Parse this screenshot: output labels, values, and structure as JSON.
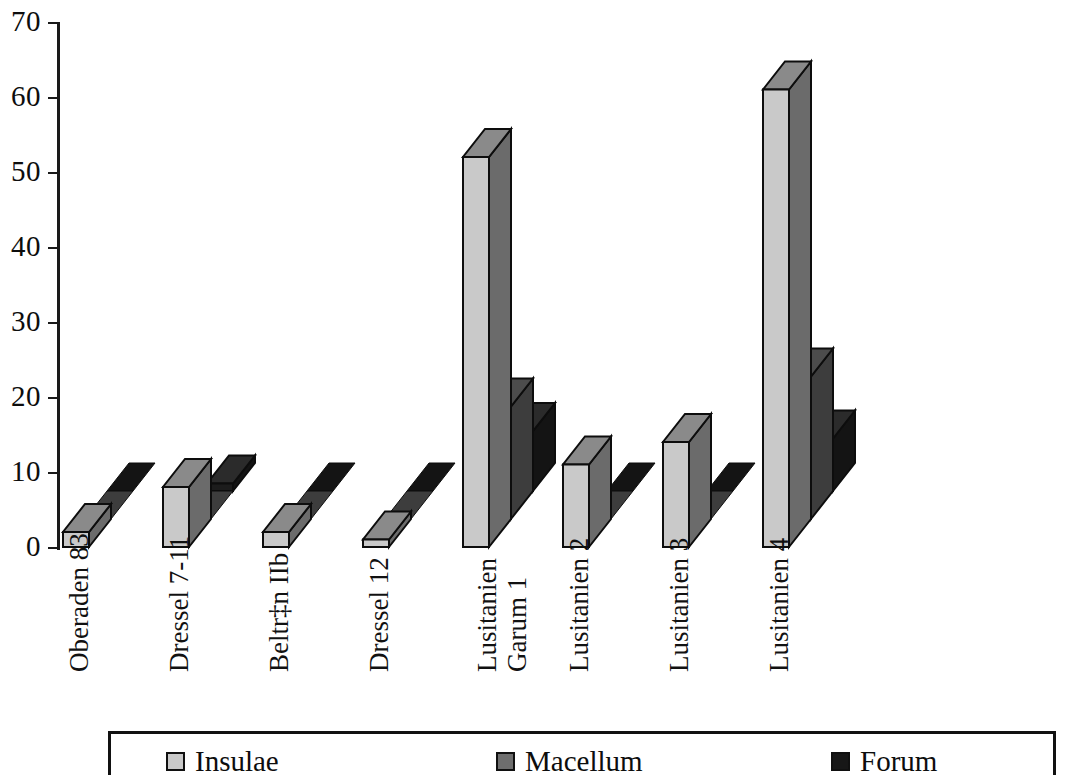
{
  "chart_data": {
    "type": "bar",
    "title": "",
    "subtitle": "",
    "xlabel": "",
    "ylabel": "",
    "ylim": [
      0,
      70
    ],
    "yticks": [
      0,
      10,
      20,
      30,
      40,
      50,
      60,
      70
    ],
    "ytick_labels": [
      "0",
      "10",
      "20",
      "30",
      "40",
      "50",
      "60",
      "70"
    ],
    "grid": false,
    "legend_position": "bottom",
    "three_d": true,
    "categories": [
      "Oberaden 83",
      "Dressel 7-11",
      "Beltr‡n IIb",
      "Dressel 12",
      "Lusitanien Garum 1",
      "Lusitanien 2",
      "Lusitanien 3",
      "Lusitanien 4"
    ],
    "category_lines": [
      [
        "Oberaden 83"
      ],
      [
        "Dressel 7-11"
      ],
      [
        "Beltr‡n IIb"
      ],
      [
        "Dressel 12"
      ],
      [
        "Lusitanien",
        "Garum 1"
      ],
      [
        "Lusitanien 2"
      ],
      [
        "Lusitanien 3"
      ],
      [
        "Lusitanien 4"
      ]
    ],
    "series": [
      {
        "name": "Insulae",
        "color": "#c9c9c9",
        "values": [
          2,
          8,
          2,
          1,
          52,
          11,
          14,
          61
        ]
      },
      {
        "name": "Macellum",
        "color": "#6e6e6e",
        "values": [
          0,
          0,
          0,
          0,
          15,
          0,
          0,
          19
        ]
      },
      {
        "name": "Forum",
        "color": "#1c1c1c",
        "values": [
          0,
          1,
          0,
          0,
          8,
          0,
          0,
          7
        ]
      }
    ]
  },
  "legend": {
    "items": [
      {
        "label": "Insulae",
        "color": "#c9c9c9"
      },
      {
        "label": "Macellum",
        "color": "#6e6e6e"
      },
      {
        "label": "Forum",
        "color": "#171717"
      }
    ]
  },
  "colors": {
    "axis": "#1a1a1a",
    "background": "#ffffff",
    "insulae_front": "#c9c9c9",
    "insulae_top": "#8a8a8a",
    "insulae_side": "#6b6b6b",
    "macellum_front": "#6e6e6e",
    "macellum_top": "#4c4c4c",
    "macellum_side": "#3d3d3d",
    "forum_front": "#1c1c1c",
    "forum_top": "#2b2b2b",
    "forum_side": "#141414"
  }
}
